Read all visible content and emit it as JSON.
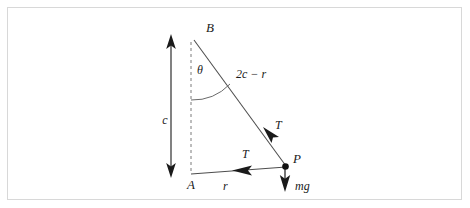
{
  "figure": {
    "type": "physics-force-diagram",
    "border_color": "#d8d8d8",
    "line_color": "#4d4d4d",
    "text_color": "#1a1a1a",
    "points": [
      {
        "id": "B",
        "label": "B",
        "x": 186,
        "y": 33
      },
      {
        "id": "A",
        "label": "A",
        "x": 183,
        "y": 168
      },
      {
        "id": "P",
        "label": "P",
        "x": 277,
        "y": 158
      }
    ],
    "labels": {
      "vertex_b": "B",
      "vertex_a": "A",
      "vertex_p": "P",
      "angle_theta": "θ",
      "side_hypotenuse": "2c − r",
      "side_vertical": "c",
      "side_horizontal": "r",
      "tension_upper": "T",
      "tension_lower": "T",
      "weight": "mg"
    },
    "segments": [
      {
        "name": "hypotenuse-BP",
        "from": "B",
        "to": "P",
        "style": "solid",
        "label": "2c − r"
      },
      {
        "name": "base-AP",
        "from": "A",
        "to": "P",
        "style": "solid",
        "label": "r"
      },
      {
        "name": "vertical-dashed-BA",
        "from": "B",
        "to": "A",
        "style": "dashed",
        "label": ""
      }
    ],
    "dimension_arrow": {
      "name": "c-measure",
      "label": "c",
      "orientation": "vertical",
      "double_headed": true,
      "x": 163,
      "y_top": 29,
      "y_bottom": 168
    },
    "forces": [
      {
        "name": "tension-along-string",
        "label": "T",
        "direction": "up-left along BP toward B"
      },
      {
        "name": "tension-horizontal",
        "label": "T",
        "direction": "left along PA toward A"
      },
      {
        "name": "weight",
        "label": "mg",
        "direction": "downward"
      }
    ]
  }
}
